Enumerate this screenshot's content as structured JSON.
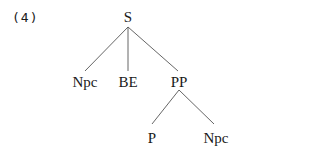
{
  "example_number": "(4)",
  "tree": {
    "root": "S",
    "children": [
      {
        "label": "Npc"
      },
      {
        "label": "BE"
      },
      {
        "label": "PP",
        "children": [
          {
            "label": "P"
          },
          {
            "label": "Npc"
          }
        ]
      }
    ]
  },
  "labels": {
    "s": "S",
    "npc1": "Npc",
    "be": "BE",
    "pp": "PP",
    "p": "P",
    "npc2": "Npc"
  },
  "colors": {
    "line": "#555555",
    "text": "#1a1a1a",
    "background": "#ffffff"
  }
}
